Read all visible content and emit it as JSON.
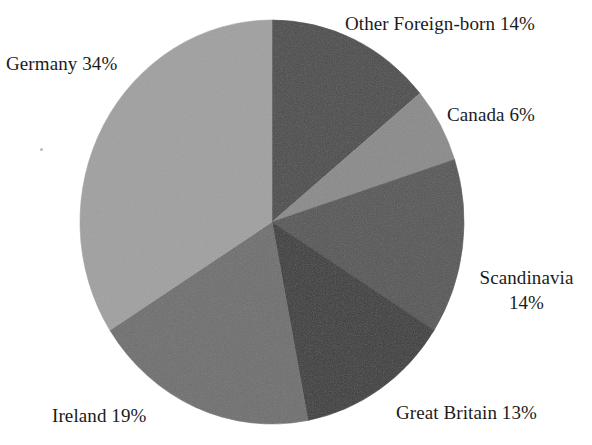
{
  "chart_data": {
    "type": "pie",
    "title": "",
    "subtitle": "",
    "xlabel": "",
    "ylabel": "",
    "legend_position": "none",
    "grid": false,
    "units": "percent",
    "total": 100,
    "start_angle_deg": 0,
    "direction": "clockwise",
    "categories": [
      "Other Foreign-born",
      "Canada",
      "Scandinavia",
      "Great Britain",
      "Ireland",
      "Germany"
    ],
    "values": [
      14,
      6,
      14,
      13,
      19,
      34
    ],
    "slices": [
      {
        "name": "Other Foreign-born",
        "value": 14,
        "label": "Other Foreign-born 14%",
        "percent_text": "14%",
        "color": "#4a4a4a",
        "start_deg": 0,
        "end_deg": 50.4
      },
      {
        "name": "Canada",
        "value": 6,
        "label": "Canada 6%",
        "percent_text": "6%",
        "color": "#8a8a8a",
        "start_deg": 50.4,
        "end_deg": 72.0
      },
      {
        "name": "Scandinavia",
        "value": 14,
        "label": "Scandinavia 14%",
        "label_line1": "Scandinavia",
        "label_line2": "14%",
        "percent_text": "14%",
        "color": "#555555",
        "start_deg": 72.0,
        "end_deg": 122.4
      },
      {
        "name": "Great Britain",
        "value": 13,
        "label": "Great Britain 13%",
        "percent_text": "13%",
        "color": "#3a3a3a",
        "start_deg": 122.4,
        "end_deg": 169.2
      },
      {
        "name": "Ireland",
        "value": 19,
        "label": "Ireland 19%",
        "percent_text": "19%",
        "color": "#6e6e6e",
        "start_deg": 169.2,
        "end_deg": 237.6
      },
      {
        "name": "Germany",
        "value": 34,
        "label": "Germany 34%",
        "percent_text": "34%",
        "color": "#a0a0a0",
        "start_deg": 237.6,
        "end_deg": 360.0
      }
    ]
  },
  "geometry": {
    "center_x": 272,
    "center_y": 222,
    "radius_x": 192,
    "radius_y": 202
  },
  "labels": {
    "other_foreign_born": "Other Foreign-born 14%",
    "canada": "Canada 6%",
    "scandinavia_line1": "Scandinavia",
    "scandinavia_line2": "14%",
    "great_britain": "Great Britain 13%",
    "ireland": "Ireland 19%",
    "germany": "Germany 34%"
  },
  "colors": {
    "background": "#ffffff",
    "text": "#1b1b1b",
    "other_foreign_born": "#4a4a4a",
    "canada": "#8a8a8a",
    "scandinavia": "#555555",
    "great_britain": "#3a3a3a",
    "ireland": "#6e6e6e",
    "germany": "#a0a0a0"
  }
}
